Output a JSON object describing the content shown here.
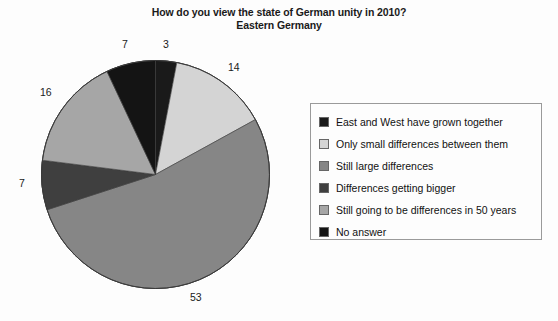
{
  "chart_data": {
    "type": "pie",
    "title": "How do you view the state of German unity in 2010?",
    "subtitle": "Eastern Germany",
    "xlabel": "",
    "ylabel": "",
    "grid": false,
    "legend_position": "right",
    "start_angle_deg": 0,
    "direction": "clockwise",
    "categories": [
      "East and West have grown together",
      "Only small differences between them",
      "Still large differences",
      "Differences getting bigger",
      "Still going to be differences in 50 years",
      "No answer"
    ],
    "values": [
      3,
      14,
      53,
      7,
      16,
      7
    ],
    "value_labels": [
      "3",
      "14",
      "53",
      "7",
      "16",
      "7"
    ],
    "colors": [
      "#1a1a1a",
      "#d4d4d4",
      "#868686",
      "#3f3f3f",
      "#a6a6a6",
      "#141414"
    ],
    "total": 100
  },
  "labels": {
    "slice_0": "3",
    "slice_1": "14",
    "slice_2": "53",
    "slice_3": "7",
    "slice_4": "16",
    "slice_5": "7"
  },
  "legend": {
    "items": [
      {
        "label": "East and West have grown together",
        "color": "#1a1a1a"
      },
      {
        "label": "Only small differences between them",
        "color": "#d4d4d4"
      },
      {
        "label": "Still large differences",
        "color": "#868686"
      },
      {
        "label": "Differences getting bigger",
        "color": "#3f3f3f"
      },
      {
        "label": "Still going to be differences in 50 years",
        "color": "#a6a6a6"
      },
      {
        "label": "No answer",
        "color": "#141414"
      }
    ]
  }
}
